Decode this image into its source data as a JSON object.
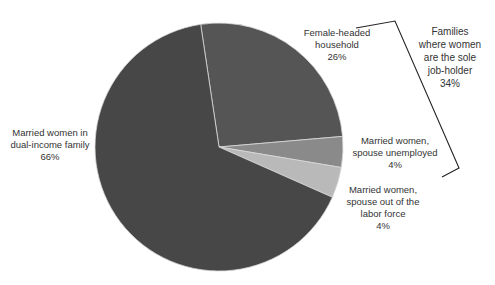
{
  "chart_data": {
    "type": "pie",
    "title": "",
    "start_angle_deg": -8.5,
    "direction": "clockwise",
    "slices": [
      {
        "label_lines": [
          "Female-headed",
          "household",
          "26%"
        ],
        "name": "Female-headed household",
        "value": 26,
        "color": "#555555"
      },
      {
        "label_lines": [
          "Married women,",
          "spouse unemployed",
          "4%"
        ],
        "name": "Married women, spouse unemployed",
        "value": 4,
        "color": "#8a8a8a"
      },
      {
        "label_lines": [
          "Married women,",
          "spouse out of the",
          "labor force",
          "4%"
        ],
        "name": "Married women, spouse out of the labor force",
        "value": 4,
        "color": "#b9b9b9"
      },
      {
        "label_lines": [
          "Married women in",
          "dual-income family",
          "66%"
        ],
        "name": "Married women in dual-income family",
        "value": 66,
        "color": "#474747"
      }
    ],
    "annotation": {
      "type": "bracket",
      "groups_slices": [
        "Female-headed household",
        "Married women, spouse unemployed",
        "Married women, spouse out of the labor force"
      ],
      "label_lines": [
        "Families",
        "where women",
        "are the sole",
        "job-holder",
        "34%"
      ],
      "value": 34
    },
    "legend": "none (data labels)",
    "center": [
      219,
      147
    ],
    "radius": 124
  }
}
